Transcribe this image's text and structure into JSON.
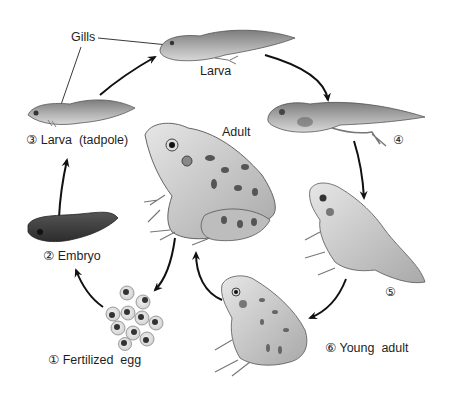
{
  "diagram": {
    "colors": {
      "ink": "#1e1e1e",
      "arrow": "#111111",
      "body_light": "#d9d9d9",
      "body_mid": "#9a9a9a",
      "body_dark": "#4a4a4a",
      "spot": "#555555"
    },
    "stages": [
      {
        "number": "①",
        "label": "① Fertilized  egg"
      },
      {
        "number": "②",
        "label": "② Embryo"
      },
      {
        "number": "③",
        "label": "③ Larva  (tadpole)"
      },
      {
        "number": "",
        "label": "Larva"
      },
      {
        "number": "④",
        "label": "④"
      },
      {
        "number": "⑤",
        "label": "⑤"
      },
      {
        "number": "⑥",
        "label": "⑥ Young  adult"
      }
    ],
    "center": {
      "label": "Adult"
    },
    "callouts": [
      {
        "label": "Gills",
        "targets": [
          "larva-top-gills",
          "tadpole-gills"
        ]
      }
    ],
    "cycle_order": [
      "Fertilized egg",
      "Embryo",
      "Larva (tadpole)",
      "Larva",
      "④",
      "⑤",
      "Young adult",
      "Adult",
      "Fertilized egg"
    ]
  }
}
